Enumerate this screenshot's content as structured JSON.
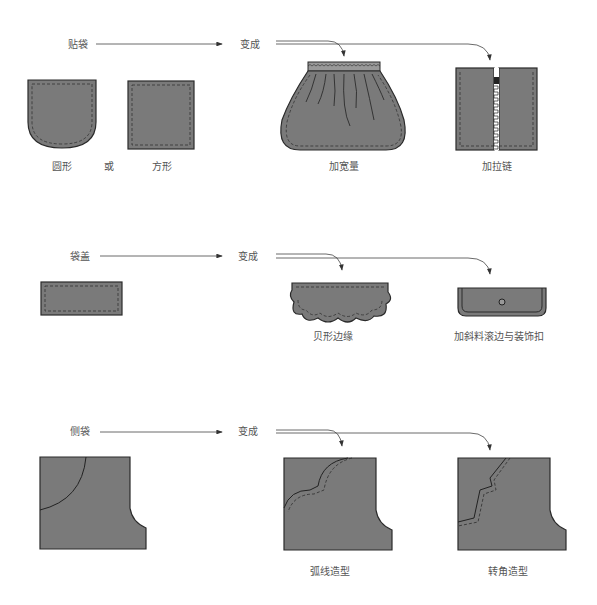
{
  "colors": {
    "fill": "#7a7a7a",
    "stroke": "#2a2a2a",
    "arrow": "#444444",
    "text": "#555555"
  },
  "rows": [
    {
      "source_label": "贴袋",
      "becomes_label": "变成",
      "source_items": [
        {
          "label": "圆形",
          "shape": "round-patch-pocket"
        },
        {
          "label": "或",
          "shape": "none"
        },
        {
          "label": "方形",
          "shape": "square-patch-pocket"
        }
      ],
      "results": [
        {
          "label": "加宽量",
          "shape": "gathered-pocket"
        },
        {
          "label": "加拉链",
          "shape": "zipper-pocket"
        }
      ]
    },
    {
      "source_label": "袋盖",
      "becomes_label": "变成",
      "source_items": [
        {
          "label": "",
          "shape": "rect-flap"
        }
      ],
      "results": [
        {
          "label": "贝形边缘",
          "shape": "scalloped-flap"
        },
        {
          "label": "加斜料滚边与装饰扣",
          "shape": "bound-flap-with-button"
        }
      ]
    },
    {
      "source_label": "侧袋",
      "becomes_label": "变成",
      "source_items": [
        {
          "label": "",
          "shape": "side-pocket"
        }
      ],
      "results": [
        {
          "label": "弧线造型",
          "shape": "curved-side-pocket"
        },
        {
          "label": "转角造型",
          "shape": "angled-side-pocket"
        }
      ]
    }
  ]
}
